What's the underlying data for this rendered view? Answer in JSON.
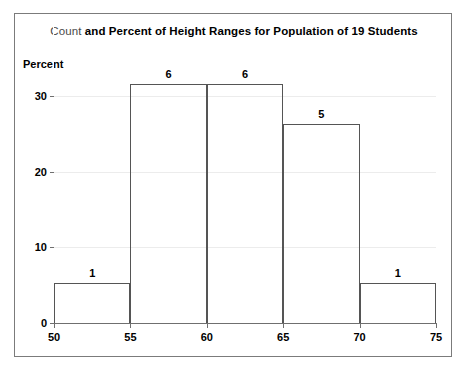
{
  "chart_data": {
    "type": "bar",
    "title": "Count and Percent of Height Ranges for Population of 19 Students",
    "title_parts": {
      "soft": "Count",
      "bold": " and Percent of Height Ranges for Population of 19 Students"
    },
    "subtitle": "",
    "xlabel": "",
    "ylabel": "Percent",
    "xlim": [
      50,
      75
    ],
    "ylim": [
      0,
      35
    ],
    "grid": true,
    "legend": "none",
    "bin_width": 5,
    "bin_edges": [
      50,
      55,
      60,
      65,
      70,
      75
    ],
    "categories": [
      "50-55",
      "55-60",
      "60-65",
      "65-70",
      "70-75"
    ],
    "counts": [
      1,
      6,
      6,
      5,
      1
    ],
    "values": [
      5.26,
      31.58,
      31.58,
      26.32,
      5.26
    ],
    "data_labels": [
      "1",
      "6",
      "6",
      "5",
      "1"
    ],
    "total_count": 19,
    "y_ticks": [
      {
        "value": 0,
        "label": "0"
      },
      {
        "value": 10,
        "label": "10"
      },
      {
        "value": 20,
        "label": "20"
      },
      {
        "value": 30,
        "label": "30"
      }
    ],
    "x_ticks": [
      {
        "value": 50,
        "label": "50"
      },
      {
        "value": 55,
        "label": "55"
      },
      {
        "value": 60,
        "label": "60"
      },
      {
        "value": 65,
        "label": "65"
      },
      {
        "value": 70,
        "label": "70"
      },
      {
        "value": 75,
        "label": "75"
      }
    ],
    "colors": {
      "bar_outline": "#555555",
      "bar_fill": "transparent",
      "gridline": "#ececec",
      "axis": "#6f6f6f",
      "frame": "#7b7b7b",
      "text": "#000000",
      "title_soft": "#4a4a4a",
      "background": "#ffffff"
    }
  }
}
